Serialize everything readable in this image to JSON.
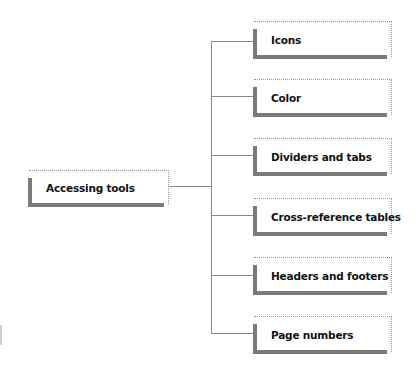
{
  "diagram": {
    "root": {
      "label": "Accessing tools"
    },
    "children": [
      {
        "label": "Icons"
      },
      {
        "label": "Color"
      },
      {
        "label": "Dividers and tabs"
      },
      {
        "label": "Cross-reference tables"
      },
      {
        "label": "Headers and footers"
      },
      {
        "label": "Page numbers"
      }
    ],
    "colors": {
      "bar": "#7a7a7a",
      "connector": "#8a8a8a",
      "text": "#111111"
    }
  }
}
